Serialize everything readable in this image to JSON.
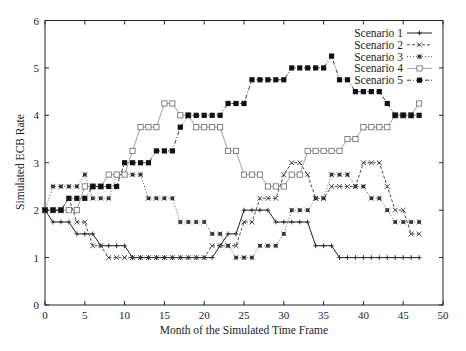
{
  "chart_data": {
    "type": "line",
    "title": "",
    "xlabel": "Month of the Simulated Time Frame",
    "ylabel": "Simulated ECB Rate",
    "xlim": [
      0,
      50
    ],
    "ylim": [
      0,
      6
    ],
    "xticks": [
      0,
      5,
      10,
      15,
      20,
      25,
      30,
      35,
      40,
      45,
      50
    ],
    "yticks": [
      0,
      1,
      2,
      3,
      4,
      5,
      6
    ],
    "grid": false,
    "legend_position": "top-right",
    "x": [
      0,
      1,
      2,
      3,
      4,
      5,
      6,
      7,
      8,
      9,
      10,
      11,
      12,
      13,
      14,
      15,
      16,
      17,
      18,
      19,
      20,
      21,
      22,
      23,
      24,
      25,
      26,
      27,
      28,
      29,
      30,
      31,
      32,
      33,
      34,
      35,
      36,
      37,
      38,
      39,
      40,
      41,
      42,
      43,
      44,
      45,
      46,
      47
    ],
    "series": [
      {
        "name": "Scenario 1",
        "style": "solid",
        "marker": "plus",
        "values": [
          2,
          1.75,
          1.75,
          1.75,
          1.5,
          1.5,
          1.5,
          1.25,
          1.25,
          1.25,
          1.25,
          1,
          1,
          1,
          1,
          1,
          1,
          1,
          1,
          1,
          1,
          1,
          1.25,
          1.5,
          1.5,
          2,
          2,
          2,
          2,
          1.75,
          1.75,
          1.75,
          1.75,
          1.75,
          1.25,
          1.25,
          1.25,
          1,
          1,
          1,
          1,
          1,
          1,
          1,
          1,
          1,
          1,
          1
        ]
      },
      {
        "name": "Scenario 2",
        "style": "dashed",
        "marker": "cross",
        "values": [
          2,
          2,
          2,
          2.25,
          1.75,
          1.75,
          1.25,
          1.25,
          1,
          1,
          1,
          1,
          1,
          1,
          1,
          1,
          1,
          1,
          1,
          1,
          1,
          1.25,
          1.25,
          1.25,
          1.25,
          1.75,
          1.75,
          2.25,
          2.25,
          2.25,
          2.75,
          3,
          3,
          2.75,
          2.25,
          2.25,
          2.5,
          2.5,
          2.5,
          2.5,
          3,
          3,
          3,
          2.5,
          2,
          2,
          1.5,
          1.5
        ]
      },
      {
        "name": "Scenario 3",
        "style": "dotted",
        "marker": "star",
        "values": [
          2,
          2.5,
          2.5,
          2.5,
          2.5,
          2.75,
          2.25,
          2.25,
          2.25,
          2.75,
          2.75,
          2.75,
          2.75,
          2.25,
          2.25,
          2.25,
          2.25,
          1.75,
          1.75,
          1.75,
          1.75,
          1.5,
          1.5,
          1.25,
          1,
          1,
          1,
          1.25,
          1.25,
          1.25,
          1.5,
          2,
          2,
          2,
          2.25,
          2.25,
          2.75,
          2.75,
          2.75,
          2.5,
          2.5,
          2.25,
          2.25,
          2,
          1.75,
          1.75,
          1.75,
          1.75
        ]
      },
      {
        "name": "Scenario 4",
        "style": "solid-light",
        "marker": "open-square",
        "values": [
          2,
          2,
          2,
          2,
          2,
          2.5,
          2.5,
          2.5,
          2.75,
          2.75,
          2.75,
          3.25,
          3.75,
          3.75,
          3.75,
          4.25,
          4.25,
          4,
          4,
          3.75,
          3.75,
          3.75,
          3.75,
          3.25,
          3.25,
          2.75,
          2.75,
          2.75,
          2.5,
          2.5,
          2.5,
          2.75,
          2.75,
          3.25,
          3.25,
          3.25,
          3.25,
          3.25,
          3.5,
          3.5,
          3.75,
          3.75,
          3.75,
          3.75,
          4,
          4,
          4,
          4.25
        ]
      },
      {
        "name": "Scenario 5",
        "style": "dash-dot",
        "marker": "filled-square",
        "values": [
          2,
          2,
          2,
          2.25,
          2.25,
          2.25,
          2.5,
          2.5,
          2.5,
          2.5,
          3,
          3,
          3,
          3,
          3.25,
          3.25,
          3.25,
          3.75,
          4,
          4,
          4,
          4,
          4,
          4.25,
          4.25,
          4.25,
          4.75,
          4.75,
          4.75,
          4.75,
          4.75,
          5,
          5,
          5,
          5,
          5,
          5.25,
          4.75,
          4.75,
          4.5,
          4.5,
          4.5,
          4.5,
          4.25,
          4,
          4,
          4,
          4
        ]
      }
    ]
  }
}
